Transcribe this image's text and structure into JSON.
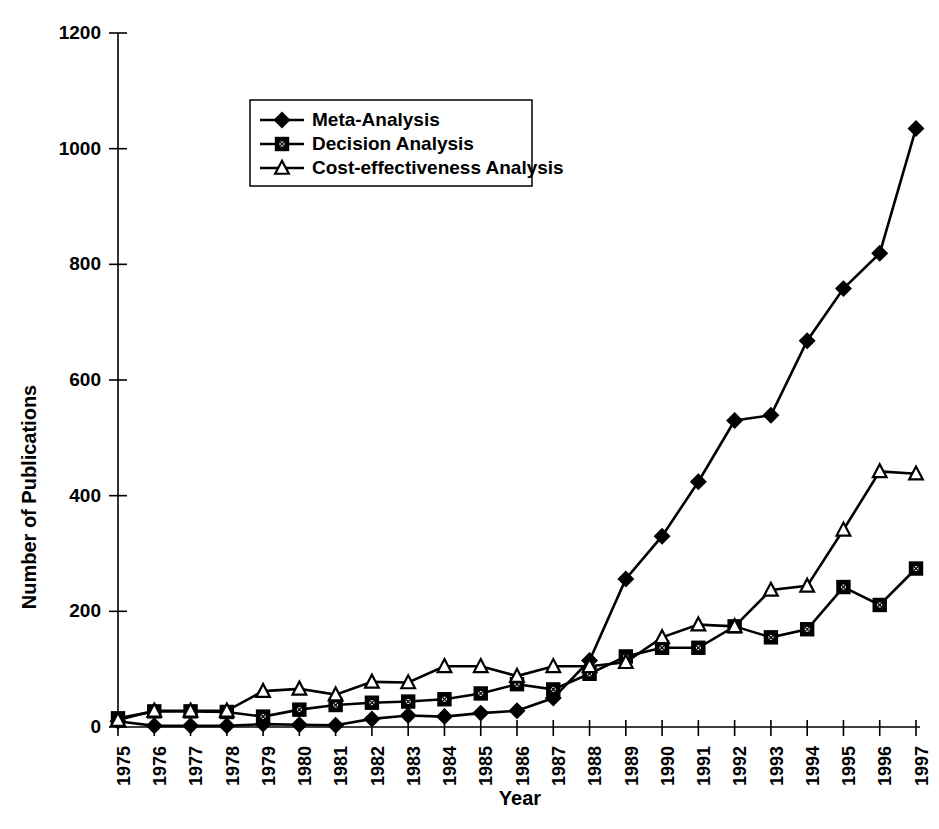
{
  "chart_data": {
    "type": "line",
    "title": "",
    "xlabel": "Year",
    "ylabel": "Number of Publications",
    "xlim": [
      1975,
      1997
    ],
    "ylim": [
      0,
      1200
    ],
    "ytick_values": [
      0,
      200,
      400,
      600,
      800,
      1000,
      1200
    ],
    "ytick_labels": [
      "0",
      "200",
      "400",
      "600",
      "800",
      "1000",
      "1200"
    ],
    "grid": false,
    "legend_position": "upper-left-inside",
    "x": [
      1975,
      1976,
      1977,
      1978,
      1979,
      1980,
      1981,
      1982,
      1983,
      1984,
      1985,
      1986,
      1987,
      1988,
      1989,
      1990,
      1991,
      1992,
      1993,
      1994,
      1995,
      1996,
      1997
    ],
    "categories": [
      "1975",
      "1976",
      "1977",
      "1978",
      "1979",
      "1980",
      "1981",
      "1982",
      "1983",
      "1984",
      "1985",
      "1986",
      "1987",
      "1988",
      "1989",
      "1990",
      "1991",
      "1992",
      "1993",
      "1994",
      "1995",
      "1996",
      "1997"
    ],
    "series": [
      {
        "name": "Meta-Analysis",
        "marker": "filled-diamond",
        "values": [
          10,
          2,
          2,
          2,
          5,
          4,
          3,
          14,
          20,
          18,
          24,
          28,
          50,
          115,
          256,
          330,
          424,
          530,
          539,
          668,
          758,
          819,
          1035
        ]
      },
      {
        "name": "Decision Analysis",
        "marker": "filled-square",
        "values": [
          15,
          27,
          27,
          26,
          18,
          30,
          38,
          42,
          44,
          48,
          58,
          74,
          65,
          92,
          122,
          137,
          137,
          174,
          155,
          169,
          242,
          211,
          274
        ]
      },
      {
        "name": "Cost-effectiveness Analysis",
        "marker": "open-triangle",
        "values": [
          12,
          28,
          28,
          28,
          62,
          66,
          56,
          78,
          77,
          105,
          105,
          88,
          105,
          105,
          112,
          155,
          177,
          174,
          237,
          244,
          341,
          442,
          438
        ]
      }
    ]
  },
  "legend": {
    "entries": [
      {
        "label": "Meta-Analysis"
      },
      {
        "label": "Decision Analysis"
      },
      {
        "label": "Cost-effectiveness Analysis"
      }
    ]
  },
  "axes": {
    "y_title": "Number of Publications",
    "x_title": "Year"
  }
}
